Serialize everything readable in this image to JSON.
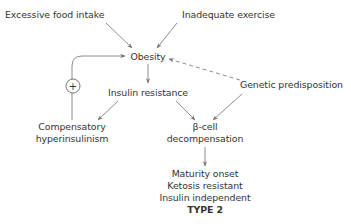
{
  "diagram": {
    "nodes": {
      "excessive_food": "Excessive food intake",
      "inadequate_exercise": "Inadequate exercise",
      "obesity": "Obesity",
      "insulin_resistance": "Insulin resistance",
      "genetic": "Genetic predisposition",
      "compensatory": [
        "Compensatory",
        "hyperinsulinism"
      ],
      "beta_cell": [
        "β-cell",
        "decompensation"
      ],
      "outcome": [
        "Maturity onset",
        "Ketosis resistant",
        "Insulin independent",
        "TYPE 2"
      ]
    },
    "feedback_symbol": "+",
    "edges": [
      {
        "from": "Excessive food intake",
        "to": "Obesity",
        "style": "solid"
      },
      {
        "from": "Inadequate exercise",
        "to": "Obesity",
        "style": "solid"
      },
      {
        "from": "Genetic predisposition",
        "to": "Obesity",
        "style": "dashed"
      },
      {
        "from": "Obesity",
        "to": "Insulin resistance",
        "style": "solid"
      },
      {
        "from": "Insulin resistance",
        "to": "Compensatory hyperinsulinism",
        "style": "solid"
      },
      {
        "from": "Insulin resistance",
        "to": "β-cell decompensation",
        "style": "solid"
      },
      {
        "from": "Genetic predisposition",
        "to": "β-cell decompensation",
        "style": "solid"
      },
      {
        "from": "Compensatory hyperinsulinism",
        "to": "Obesity",
        "style": "solid",
        "label": "+"
      },
      {
        "from": "β-cell decompensation",
        "to": "Type 2",
        "style": "solid"
      }
    ],
    "colors": {
      "text": "#333333",
      "line": "#777777"
    }
  }
}
